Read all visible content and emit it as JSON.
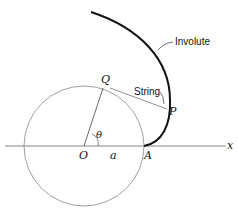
{
  "diagram": {
    "labels": {
      "involute": "Involute",
      "string": "String",
      "P": "P",
      "Q": "Q",
      "O": "O",
      "A": "A",
      "a": "a",
      "theta": "θ",
      "x": "x"
    }
  }
}
